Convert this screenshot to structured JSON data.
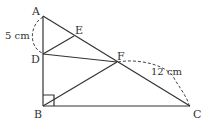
{
  "diagram": {
    "points": {
      "A": {
        "label": "A",
        "x": 43,
        "y": 16
      },
      "B": {
        "label": "B",
        "x": 43,
        "y": 106
      },
      "C": {
        "label": "C",
        "x": 190,
        "y": 106
      },
      "D": {
        "label": "D",
        "x": 43,
        "y": 54
      },
      "E": {
        "label": "E",
        "x": 74,
        "y": 36
      },
      "F": {
        "label": "F",
        "x": 117,
        "y": 62
      }
    },
    "segments": [
      "AB",
      "BC",
      "AC",
      "DE",
      "DF",
      "BF"
    ],
    "right_angle_at": "B",
    "measurements": {
      "AD": "5 cm",
      "FC": "12 cm"
    },
    "line_color": "#333333"
  }
}
